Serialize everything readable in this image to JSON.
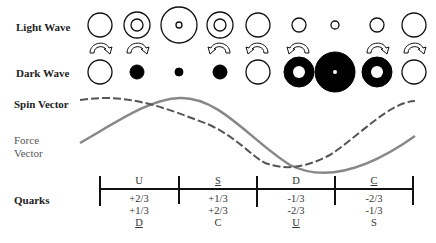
{
  "labels": {
    "light_wave": "Light Wave",
    "dark_wave": "Dark Wave",
    "spin_vector": "Spin Vector",
    "force_vector_line1": "Force",
    "force_vector_line2": "Vector",
    "quarks": "Quarks"
  },
  "light_wave_circles": [
    {
      "x": 100,
      "r": 12,
      "inner": 0
    },
    {
      "x": 137,
      "r": 13,
      "inner": 6
    },
    {
      "x": 179,
      "r": 18,
      "inner": 3
    },
    {
      "x": 220,
      "r": 13,
      "inner": 6
    },
    {
      "x": 258,
      "r": 12,
      "inner": 0
    },
    {
      "x": 299,
      "r": 7,
      "inner": 0
    },
    {
      "x": 335,
      "r": 4,
      "inner": 0
    },
    {
      "x": 377,
      "r": 7,
      "inner": 0
    },
    {
      "x": 414,
      "r": 12,
      "inner": 0
    }
  ],
  "dark_wave_circles": [
    {
      "x": 100,
      "type": "open",
      "r": 12,
      "hole": 0
    },
    {
      "x": 137,
      "type": "filled",
      "r": 7,
      "hole": 0
    },
    {
      "x": 179,
      "type": "filled",
      "r": 4,
      "hole": 0
    },
    {
      "x": 220,
      "type": "filled",
      "r": 7,
      "hole": 0
    },
    {
      "x": 258,
      "type": "open",
      "r": 12,
      "hole": 0
    },
    {
      "x": 299,
      "type": "filled",
      "r": 15,
      "hole": 6
    },
    {
      "x": 335,
      "type": "filled",
      "r": 20,
      "hole": 2
    },
    {
      "x": 377,
      "type": "filled",
      "r": 15,
      "hole": 6
    },
    {
      "x": 414,
      "type": "open",
      "r": 12,
      "hole": 0
    }
  ],
  "arrows": [
    {
      "x": 100,
      "dir": "right"
    },
    {
      "x": 137,
      "dir": "right"
    },
    {
      "x": 220,
      "dir": "left"
    },
    {
      "x": 258,
      "dir": "left"
    },
    {
      "x": 299,
      "dir": "left"
    },
    {
      "x": 377,
      "dir": "right"
    },
    {
      "x": 414,
      "dir": "right"
    }
  ],
  "quarks": [
    {
      "top": "U",
      "top_underline": false,
      "values": [
        "+2/3",
        "+1/3"
      ],
      "bottom": "D",
      "bottom_underline": true
    },
    {
      "top": "S",
      "top_underline": true,
      "values": [
        "+1/3",
        "+2/3"
      ],
      "bottom": "C",
      "bottom_underline": false
    },
    {
      "top": "D",
      "top_underline": false,
      "values": [
        "-1/3",
        "-2/3"
      ],
      "bottom": "U",
      "bottom_underline": true
    },
    {
      "top": "C",
      "top_underline": true,
      "values": [
        "-2/3",
        "-1/3"
      ],
      "bottom": "S",
      "bottom_underline": false
    }
  ]
}
